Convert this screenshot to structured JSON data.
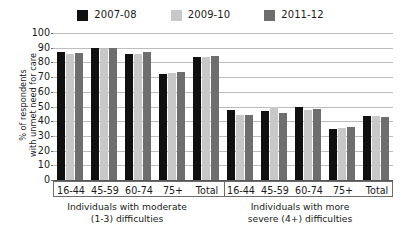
{
  "chart_data": {
    "type": "bar",
    "title": "",
    "xlabel": "",
    "ylabel": "% of respondents\nwith unmet need for care",
    "ylim": [
      0,
      100
    ],
    "ytick_step": 10,
    "yticks": [
      100,
      90,
      80,
      70,
      60,
      50,
      40,
      30,
      20,
      10,
      0
    ],
    "grid": true,
    "legend_position": "top-center",
    "series": [
      {
        "name": "2007-08",
        "color": "#101010",
        "values": [
          87,
          90,
          85.5,
          72,
          83.5,
          47.5,
          47,
          50,
          35,
          43.5
        ]
      },
      {
        "name": "2009-10",
        "color": "#c8c8c8",
        "values": [
          85.5,
          89,
          86,
          72.5,
          83.5,
          44,
          50,
          47.5,
          35.5,
          43.5
        ]
      },
      {
        "name": "2011-12",
        "color": "#6e6e6e",
        "values": [
          86.5,
          90,
          87,
          73.5,
          84.5,
          44.5,
          45.5,
          48.5,
          36,
          43
        ]
      }
    ],
    "panels": [
      {
        "caption": "Individuals with moderate\n(1-3) difficulties",
        "caption_line1": "Individuals with moderate",
        "caption_line2": "(1-3) difficulties",
        "categories": [
          "16-44",
          "45-59",
          "60-74",
          "75+",
          "Total"
        ]
      },
      {
        "caption": "Individuals with more\nsevere (4+) difficulties",
        "caption_line1": "Individuals with more",
        "caption_line2": "severe (4+) difficulties",
        "categories": [
          "16-44",
          "45-59",
          "60-74",
          "75+",
          "Total"
        ]
      }
    ],
    "categories": [
      "16-44",
      "45-59",
      "60-74",
      "75+",
      "Total",
      "16-44",
      "45-59",
      "60-74",
      "75+",
      "Total"
    ]
  },
  "axis": {
    "y_title_line1": "% of respondents",
    "y_title_line2": "with unmet need for care"
  },
  "legend": {
    "items": [
      {
        "label": "2007-08",
        "color": "#101010"
      },
      {
        "label": "2009-10",
        "color": "#c8c8c8"
      },
      {
        "label": "2011-12",
        "color": "#6e6e6e"
      }
    ]
  },
  "colors": {
    "series_2007_08": "#101010",
    "series_2009_10": "#c8c8c8",
    "series_2011_12": "#6e6e6e",
    "gridline": "#bdbdbd",
    "axis": "#6d6d6d",
    "background": "#ffffff",
    "text": "#1a1a1a"
  }
}
